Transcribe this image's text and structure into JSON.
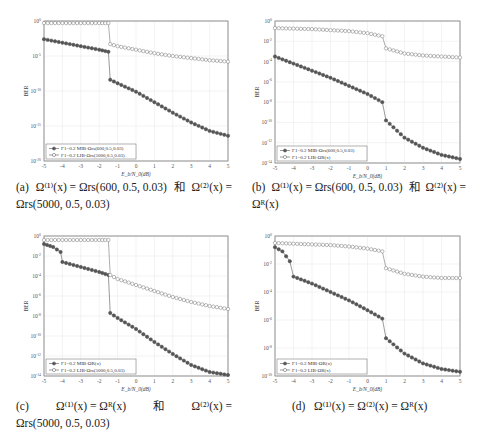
{
  "chart_data": [
    {
      "id": "a",
      "type": "line",
      "yscale": "log",
      "xlabel": "E_b/N_0(dB)",
      "ylabel": "BER",
      "xlim": [
        -5,
        5
      ],
      "ylim_exp": [
        -20,
        0
      ],
      "xticks": [
        -5,
        -4,
        -3,
        -2,
        -1,
        0,
        1,
        2,
        3,
        4,
        5
      ],
      "yticks_exp": [
        0,
        -5,
        -10,
        -15,
        -20
      ],
      "grid": true,
      "legend_position": "lower left",
      "series": [
        {
          "name": "Γ1=0.2 MIB-Ωrs(600,0.5,0.03)",
          "marker": "filled-circle",
          "x": [
            -5,
            -4,
            -3,
            -2,
            -1.5,
            -1.4,
            -1,
            0,
            1,
            2,
            3,
            4,
            5
          ],
          "log10_y": [
            -2.6,
            -3.1,
            -3.6,
            -4.1,
            -4.4,
            -8.4,
            -8.9,
            -10.1,
            -11.6,
            -13.1,
            -14.5,
            -15.7,
            -16.4
          ]
        },
        {
          "name": "Γ1=0.2 LIB-Ωrs(5000,0.5,0.03)",
          "marker": "open-circle",
          "x": [
            -5,
            -4,
            -3,
            -2,
            -1.5,
            -1.4,
            -1,
            0,
            1,
            2,
            3,
            4,
            5
          ],
          "log10_y": [
            -0.3,
            -0.3,
            -0.3,
            -0.3,
            -0.3,
            -3.3,
            -3.6,
            -4.1,
            -4.6,
            -5.0,
            -5.3,
            -5.6,
            -5.8
          ]
        }
      ]
    },
    {
      "id": "b",
      "type": "line",
      "yscale": "log",
      "xlabel": "E_b/N_0(dB)",
      "ylabel": "BER",
      "xlim": [
        -5,
        5
      ],
      "ylim_exp": [
        -14,
        0
      ],
      "xticks": [
        -5,
        -4,
        -3,
        -2,
        -1,
        0,
        1,
        2,
        3,
        4,
        5
      ],
      "yticks_exp": [
        0,
        -2,
        -4,
        -6,
        -8,
        -10,
        -12,
        -14
      ],
      "grid": true,
      "legend_position": "lower left",
      "series": [
        {
          "name": "Γ1=0.2 MIB-Ωrs(600,0.5,0.03)",
          "marker": "filled-circle",
          "x": [
            -5,
            -4,
            -3,
            -2,
            -1,
            0,
            0.8,
            1.0,
            2,
            3,
            4,
            5
          ],
          "log10_y": [
            -3.5,
            -4.2,
            -4.9,
            -5.6,
            -6.4,
            -7.2,
            -8.0,
            -9.8,
            -11.5,
            -12.5,
            -13.2,
            -13.6
          ]
        },
        {
          "name": "Γ1=0.2 LIB-ΩR(x)",
          "marker": "open-circle",
          "x": [
            -5,
            -4,
            -3,
            -2,
            -1,
            0,
            0.8,
            1.0,
            2,
            3,
            4,
            5
          ],
          "log10_y": [
            -0.7,
            -0.75,
            -0.8,
            -0.9,
            -1.0,
            -1.2,
            -1.5,
            -2.7,
            -3.2,
            -3.4,
            -3.5,
            -3.6
          ]
        }
      ]
    },
    {
      "id": "c",
      "type": "line",
      "yscale": "log",
      "xlabel": "E_b/N_0(dB)",
      "ylabel": "BER",
      "xlim": [
        -5,
        5
      ],
      "ylim_exp": [
        -14,
        0
      ],
      "xticks": [
        -5,
        -4,
        -3,
        -2,
        -1,
        0,
        1,
        2,
        3,
        4,
        5
      ],
      "yticks_exp": [
        0,
        -2,
        -4,
        -6,
        -8,
        -10,
        -12,
        -14
      ],
      "grid": true,
      "legend_position": "lower left",
      "series": [
        {
          "name": "Γ1=0.2 MIB-ΩR(x)",
          "marker": "filled-circle",
          "x": [
            -5,
            -4.5,
            -4.1,
            -4.0,
            -3,
            -2,
            -1.5,
            -1.4,
            -1,
            0,
            1,
            2,
            3,
            4,
            5
          ],
          "log10_y": [
            -0.8,
            -1.1,
            -1.6,
            -2.6,
            -3.1,
            -3.6,
            -3.9,
            -7.7,
            -8.2,
            -9.3,
            -10.6,
            -11.8,
            -12.9,
            -13.6,
            -13.9
          ]
        },
        {
          "name": "Γ1=0.2 LIB-Ωrs(5000,0.5,0.03)",
          "marker": "open-circle",
          "x": [
            -5,
            -4,
            -3,
            -2,
            -1.5,
            -1.4,
            -1,
            0,
            1,
            2,
            3,
            4,
            5
          ],
          "log10_y": [
            -0.4,
            -0.4,
            -0.4,
            -0.4,
            -0.4,
            -3.9,
            -4.3,
            -4.9,
            -5.5,
            -6.1,
            -6.6,
            -7.0,
            -7.3
          ]
        }
      ]
    },
    {
      "id": "d",
      "type": "line",
      "yscale": "log",
      "xlabel": "E_b/N_0(dB)",
      "ylabel": "BER",
      "xlim": [
        -5,
        5
      ],
      "ylim_exp": [
        -10,
        0
      ],
      "xticks": [
        -5,
        -4,
        -3,
        -2,
        -1,
        0,
        1,
        2,
        3,
        4,
        5
      ],
      "yticks_exp": [
        0,
        -2,
        -4,
        -6,
        -8,
        -10
      ],
      "grid": true,
      "legend_position": "lower left",
      "series": [
        {
          "name": "Γ1=0.2 MIB-ΩR(x)",
          "marker": "filled-circle",
          "x": [
            -5,
            -4.6,
            -4.2,
            -4.0,
            -3,
            -2,
            -1,
            0,
            0.8,
            1.0,
            2,
            3,
            4,
            5
          ],
          "log10_y": [
            -0.8,
            -1.1,
            -1.8,
            -2.9,
            -3.4,
            -4.0,
            -4.6,
            -5.3,
            -5.9,
            -7.3,
            -8.4,
            -9.1,
            -9.5,
            -9.7
          ]
        },
        {
          "name": "Γ1=0.2 LIB-ΩR(x)",
          "marker": "open-circle",
          "x": [
            -5,
            -4,
            -3,
            -2,
            -1,
            0,
            0.8,
            1.0,
            2,
            3,
            4,
            5
          ],
          "log10_y": [
            -0.5,
            -0.55,
            -0.6,
            -0.65,
            -0.75,
            -0.9,
            -1.1,
            -2.3,
            -2.7,
            -2.9,
            -3.0,
            -3.0
          ]
        }
      ]
    }
  ],
  "captions": {
    "a": {
      "label": "(a)",
      "line1_left": "Ω⁽¹⁾(x) = Ωrs(600, 0.5, 0.03)",
      "conj": "和",
      "line1_right": "Ω⁽²⁾(x) =",
      "line2": "Ωrs(5000, 0.5, 0.03)"
    },
    "b": {
      "label": "(b)",
      "line1_left": "Ω⁽¹⁾(x) = Ωrs(600, 0.5, 0.03)",
      "conj": "和",
      "line1_right": "Ω⁽²⁾(x) =",
      "line2": "Ωᴿ(x)"
    },
    "c": {
      "label": "(c)",
      "line1_left": "Ω⁽¹⁾(x)   =   Ωᴿ(x)",
      "conj": "和",
      "line1_right": "Ω⁽²⁾(x)   =",
      "line2": "Ωrs(5000, 0.5, 0.03)"
    },
    "d": {
      "label": "(d)",
      "line1": "Ω⁽¹⁾(x) = Ω⁽²⁾(x) = Ωᴿ(x)"
    }
  },
  "colors": {
    "filled_marker": "#555555",
    "open_marker": "#777777",
    "grid": "#e6e6e6",
    "frame": "#888888"
  }
}
